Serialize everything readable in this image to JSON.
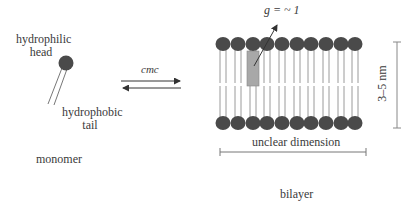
{
  "diagram": {
    "monomer": {
      "head_label_line1": "hydrophilic",
      "head_label_line2": "head",
      "tail_label_line1": "hydrophobic",
      "tail_label_line2": "tail",
      "caption": "monomer"
    },
    "equilibrium": {
      "label": "cmc"
    },
    "bilayer": {
      "packing_parameter": "g = ~ 1",
      "thickness": "3–5 nm",
      "width": "unclear dimension",
      "caption": "bilayer",
      "head_count_per_leaflet": 10
    },
    "colors": {
      "head_fill": "#4a4a4a",
      "tail_line": "#999999",
      "highlight_box": "#a8a8a8",
      "text": "#3a3a3a"
    }
  }
}
